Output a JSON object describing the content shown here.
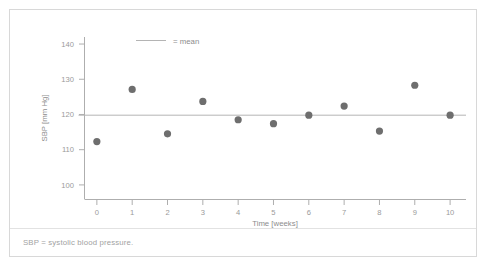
{
  "figure": {
    "footnote": "SBP = systolic blood pressure.",
    "legend_label": "= mean",
    "colors": {
      "marker": "#6e6e6e",
      "mean_line": "#b4b4b4",
      "axis": "#aeaeae",
      "text": "#8c8c8c",
      "border": "#d8d8d8"
    }
  },
  "chart_data": {
    "type": "scatter",
    "title": "",
    "xlabel": "Time [weeks]",
    "ylabel": "SBP [mm Hg]",
    "x": [
      0,
      1,
      2,
      3,
      4,
      5,
      6,
      7,
      8,
      9,
      10
    ],
    "y": [
      112.3,
      127.1,
      114.5,
      123.7,
      118.5,
      117.4,
      119.8,
      122.4,
      115.3,
      128.3,
      119.8
    ],
    "xlim": [
      -0.35,
      10.45
    ],
    "ylim": [
      96,
      142
    ],
    "xticks": [
      0,
      1,
      2,
      3,
      4,
      5,
      6,
      7,
      8,
      9,
      10
    ],
    "xticklabels": [
      "0",
      "1",
      "2",
      "3",
      "4",
      "5",
      "6",
      "7",
      "8",
      "9",
      "10"
    ],
    "yticks": [
      100,
      110,
      120,
      130,
      140
    ],
    "yticklabels": [
      "100",
      "110",
      "120",
      "130",
      "140"
    ],
    "grid": false,
    "legend_position": "top-center",
    "annotations": [
      {
        "name": "mean-line",
        "type": "hline",
        "value": 119.8,
        "label": "= mean"
      }
    ]
  }
}
